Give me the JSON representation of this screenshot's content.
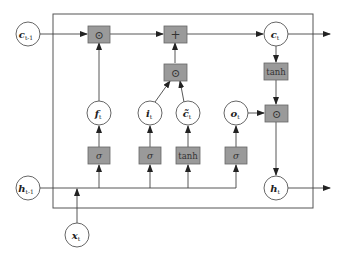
{
  "diagram": {
    "type": "LSTM cell",
    "colors": {
      "box_fill": "#9a9a9a",
      "box_stroke": "#666666",
      "line": "#444444",
      "frame": "#555555",
      "circle_fill": "#ffffff"
    },
    "nodes": {
      "c_prev": {
        "base": "c",
        "sub": "t-1"
      },
      "h_prev": {
        "base": "h",
        "sub": "t-1"
      },
      "x_t": {
        "base": "x",
        "sub": "t"
      },
      "f_t": {
        "base": "f",
        "sub": "t"
      },
      "i_t": {
        "base": "i",
        "sub": "t"
      },
      "c_tilde": {
        "base": "c̃",
        "sub": "t"
      },
      "o_t": {
        "base": "o",
        "sub": "t"
      },
      "c_t": {
        "base": "c",
        "sub": "t"
      },
      "h_t": {
        "base": "h",
        "sub": "t"
      }
    },
    "ops": {
      "forget_mult": "⊙",
      "add": "+",
      "input_mult": "⊙",
      "output_mult": "⊙",
      "tanh_out": "tanh",
      "sigma_f": "σ",
      "sigma_i": "σ",
      "tanh_c": "tanh",
      "sigma_o": "σ"
    }
  }
}
